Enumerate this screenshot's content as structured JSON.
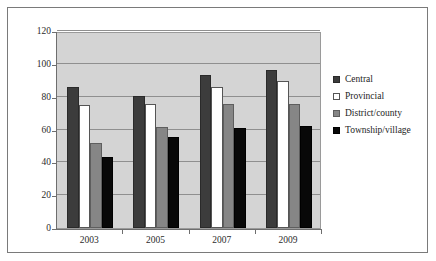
{
  "chart_data": {
    "type": "bar",
    "title": "",
    "subtitle": "",
    "xlabel": "",
    "ylabel": "",
    "categories": [
      "2003",
      "2005",
      "2007",
      "2009"
    ],
    "series": [
      {
        "name": "Central",
        "color": "#3c3c3c",
        "values": [
          86,
          80.5,
          93,
          96.5
        ]
      },
      {
        "name": "Provincial",
        "color": "#ffffff",
        "values": [
          75,
          75.5,
          86,
          89.5
        ]
      },
      {
        "name": "District/county",
        "color": "#868686",
        "values": [
          52,
          61.5,
          75.5,
          75.5
        ]
      },
      {
        "name": "Township/village",
        "color": "#080808",
        "values": [
          43.5,
          55.5,
          61,
          62
        ]
      }
    ],
    "ylim": [
      0,
      120
    ],
    "yticks": [
      0,
      20,
      40,
      60,
      80,
      100,
      120
    ],
    "ytick_labels": [
      "0",
      "20",
      "40",
      "60",
      "80",
      "100",
      "120"
    ],
    "grid": true,
    "grid_axis": "y",
    "legend_position": "right",
    "plot_background": "#d4d4d4",
    "figure_background": "#ffffff",
    "border_color": "#7a7a7a"
  }
}
